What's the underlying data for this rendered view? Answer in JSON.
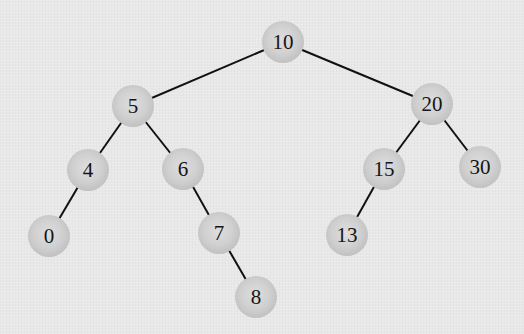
{
  "diagram": {
    "type": "binary-search-tree",
    "colors": {
      "background": "#e8e8e8",
      "node_fill": "#c8c8c8",
      "edge": "#111111",
      "text": "#151515"
    },
    "nodes": [
      {
        "id": "n10",
        "label": "10",
        "x": 283,
        "y": 42
      },
      {
        "id": "n5",
        "label": "5",
        "x": 133,
        "y": 106
      },
      {
        "id": "n20",
        "label": "20",
        "x": 432,
        "y": 104
      },
      {
        "id": "n4",
        "label": "4",
        "x": 88,
        "y": 170
      },
      {
        "id": "n6",
        "label": "6",
        "x": 183,
        "y": 169
      },
      {
        "id": "n15",
        "label": "15",
        "x": 384,
        "y": 169
      },
      {
        "id": "n30",
        "label": "30",
        "x": 480,
        "y": 167
      },
      {
        "id": "n0",
        "label": "0",
        "x": 49,
        "y": 236
      },
      {
        "id": "n7",
        "label": "7",
        "x": 219,
        "y": 233
      },
      {
        "id": "n13",
        "label": "13",
        "x": 347,
        "y": 235
      },
      {
        "id": "n8",
        "label": "8",
        "x": 256,
        "y": 297
      }
    ],
    "edges": [
      {
        "from": "10",
        "to": "5"
      },
      {
        "from": "10",
        "to": "20"
      },
      {
        "from": "5",
        "to": "4"
      },
      {
        "from": "5",
        "to": "6"
      },
      {
        "from": "4",
        "to": "0"
      },
      {
        "from": "6",
        "to": "7"
      },
      {
        "from": "7",
        "to": "8"
      },
      {
        "from": "20",
        "to": "15"
      },
      {
        "from": "20",
        "to": "30"
      },
      {
        "from": "15",
        "to": "13"
      }
    ]
  }
}
